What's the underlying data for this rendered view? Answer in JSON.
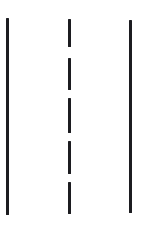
{
  "diagram": {
    "canvas": {
      "width": 153,
      "height": 231,
      "background_color": "#ffffff"
    },
    "line_color": "#1c1c20",
    "elements": [
      {
        "name": "left-solid-lane-line",
        "label": "Left solid edge line",
        "style": "solid",
        "x": 6,
        "y": 18,
        "width": 3,
        "height": 197
      },
      {
        "name": "center-dashed-lane-line",
        "label": "Center dashed line",
        "style": "dashed",
        "x": 68,
        "y": 19,
        "width": 3,
        "height": 195,
        "dashes": [
          {
            "y": 19,
            "height": 28
          },
          {
            "y": 58,
            "height": 32
          },
          {
            "y": 98,
            "height": 35
          },
          {
            "y": 141,
            "height": 33
          },
          {
            "y": 182,
            "height": 32
          }
        ]
      },
      {
        "name": "right-solid-lane-line",
        "label": "Right solid edge line",
        "style": "solid",
        "x": 129,
        "y": 20,
        "width": 3,
        "height": 193
      }
    ]
  }
}
